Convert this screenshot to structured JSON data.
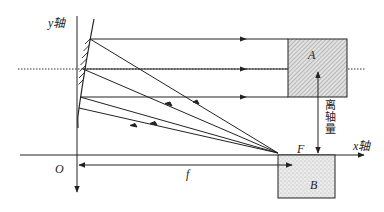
{
  "diagram": {
    "type": "off-axis parabolic mirror optics",
    "labels": {
      "y_axis": "y轴",
      "x_axis": "x轴",
      "origin": "O",
      "focus": "F",
      "focal_length": "f",
      "region_a": "A",
      "region_b": "B",
      "off_axis": "离轴量"
    },
    "colors": {
      "line": "#222222",
      "hatch_fill": "#d6d6d6",
      "stipple_fill": "#e4e4e4",
      "background": "#ffffff"
    },
    "elements": [
      "y-axis (vertical, pointing down arrow at bottom)",
      "x-axis (horizontal, arrow to right)",
      "parabolic mirror segment with hatching",
      "optical axis (dotted horizontal line)",
      "3 parallel outgoing rays to box A",
      "4 converging rays from focus F to mirror",
      "focal length dimension arrow f",
      "off-axis distance double arrow",
      "hatched box A",
      "stippled box B"
    ]
  }
}
